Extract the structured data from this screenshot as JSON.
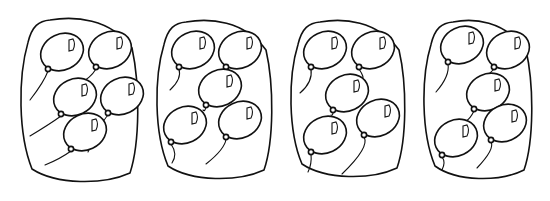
{
  "worksheet": {
    "description": "Four groups of balloons, five balloons each",
    "colors": {
      "line": "#111111",
      "background": "#ffffff"
    },
    "groups": [
      {
        "id": 1,
        "count": 5,
        "container": {
          "x": 22,
          "y": 20,
          "w": 116,
          "h": 163
        },
        "balloons": [
          {
            "cx": 62,
            "cy": 52,
            "string": [
              [
                44,
                78
              ],
              [
                38,
                90
              ],
              [
                30,
                100
              ]
            ]
          },
          {
            "cx": 110,
            "cy": 50,
            "string": [
              [
                90,
                75
              ],
              [
                84,
                80
              ],
              [
                78,
                84
              ]
            ]
          },
          {
            "cx": 75,
            "cy": 97,
            "string": [
              [
                50,
                120
              ],
              [
                40,
                128
              ],
              [
                30,
                136
              ]
            ]
          },
          {
            "cx": 122,
            "cy": 96,
            "string": [
              [
                100,
                120
              ],
              [
                96,
                135
              ],
              [
                88,
                152
              ]
            ]
          },
          {
            "cx": 85,
            "cy": 132,
            "string": [
              [
                60,
                155
              ],
              [
                52,
                160
              ],
              [
                45,
                165
              ]
            ]
          }
        ]
      },
      {
        "id": 2,
        "count": 5,
        "container": {
          "x": 158,
          "y": 22,
          "w": 114,
          "h": 158
        },
        "balloons": [
          {
            "cx": 193,
            "cy": 50,
            "string": [
              [
                182,
                75
              ],
              [
                176,
                82
              ],
              [
                170,
                90
              ]
            ]
          },
          {
            "cx": 240,
            "cy": 50,
            "string": [
              [
                230,
                70
              ],
              [
                229,
                72
              ],
              [
                228,
                72
              ]
            ]
          },
          {
            "cx": 220,
            "cy": 88,
            "string": [
              [
                205,
                108
              ],
              [
                204,
                110
              ],
              [
                203,
                110
              ]
            ]
          },
          {
            "cx": 185,
            "cy": 125,
            "string": [
              [
                178,
                150
              ],
              [
                172,
                160
              ],
              [
                172,
                163
              ]
            ]
          },
          {
            "cx": 240,
            "cy": 120,
            "string": [
              [
                225,
                145
              ],
              [
                220,
                155
              ],
              [
                206,
                164
              ]
            ]
          }
        ]
      },
      {
        "id": 3,
        "count": 5,
        "container": {
          "x": 292,
          "y": 22,
          "w": 113,
          "h": 156
        },
        "balloons": [
          {
            "cx": 325,
            "cy": 50,
            "string": [
              [
                313,
                78
              ],
              [
                306,
                86
              ],
              [
                300,
                93
              ]
            ]
          },
          {
            "cx": 373,
            "cy": 50,
            "string": [
              [
                365,
                74
              ],
              [
                363,
                77
              ],
              [
                362,
                79
              ]
            ]
          },
          {
            "cx": 347,
            "cy": 93,
            "string": [
              [
                333,
                112
              ],
              [
                332,
                114
              ],
              [
                331,
                115
              ]
            ]
          },
          {
            "cx": 325,
            "cy": 135,
            "string": [
              [
                312,
                160
              ],
              [
                310,
                165
              ],
              [
                308,
                172
              ]
            ]
          },
          {
            "cx": 378,
            "cy": 118,
            "string": [
              [
                370,
                143
              ],
              [
                350,
                152
              ],
              [
                342,
                174
              ]
            ]
          }
        ]
      },
      {
        "id": 4,
        "count": 5,
        "container": {
          "x": 425,
          "y": 22,
          "w": 107,
          "h": 158
        },
        "balloons": [
          {
            "cx": 462,
            "cy": 45,
            "string": [
              [
                450,
                72
              ],
              [
                446,
                84
              ],
              [
                436,
                92
              ]
            ]
          },
          {
            "cx": 508,
            "cy": 50,
            "string": [
              [
                490,
                70
              ],
              [
                488,
                74
              ],
              [
                484,
                77
              ]
            ]
          },
          {
            "cx": 488,
            "cy": 92,
            "string": [
              [
                470,
                115
              ],
              [
                468,
                118
              ],
              [
                466,
                121
              ]
            ]
          },
          {
            "cx": 456,
            "cy": 138,
            "string": [
              [
                446,
                158
              ],
              [
                444,
                165
              ],
              [
                442,
                170
              ]
            ]
          },
          {
            "cx": 505,
            "cy": 123,
            "string": [
              [
                495,
                145
              ],
              [
                485,
                160
              ],
              [
                477,
                168
              ]
            ]
          }
        ]
      }
    ]
  }
}
